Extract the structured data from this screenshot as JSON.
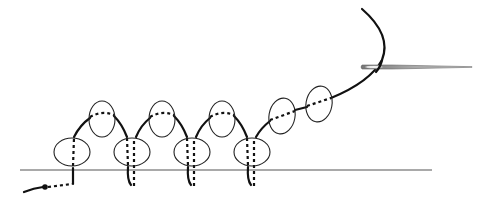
{
  "diagram": {
    "type": "beadwork-stitch-illustration",
    "colors": {
      "background": "#ffffff",
      "thread": "#111111",
      "bead_outline": "#222222",
      "base_line": "#555555",
      "needle": "#888888"
    },
    "base_line": {
      "x1": 20,
      "x2": 432,
      "y": 170
    },
    "bottom_beads": [
      {
        "cx": 72,
        "cy": 152,
        "rx": 18,
        "ry": 14
      },
      {
        "cx": 132,
        "cy": 152,
        "rx": 18,
        "ry": 14
      },
      {
        "cx": 192,
        "cy": 152,
        "rx": 18,
        "ry": 14
      },
      {
        "cx": 252,
        "cy": 152,
        "rx": 18,
        "ry": 14
      }
    ],
    "top_beads": [
      {
        "cx": 102,
        "cy": 119,
        "rx": 13,
        "ry": 18
      },
      {
        "cx": 162,
        "cy": 119,
        "rx": 13,
        "ry": 18
      },
      {
        "cx": 222,
        "cy": 119,
        "rx": 13,
        "ry": 18
      },
      {
        "cx": 282,
        "cy": 116,
        "rx": 13,
        "ry": 18
      },
      {
        "cx": 319,
        "cy": 104,
        "rx": 13,
        "ry": 18
      }
    ],
    "needle": {
      "x1": 361,
      "x2": 472,
      "y": 67
    }
  }
}
